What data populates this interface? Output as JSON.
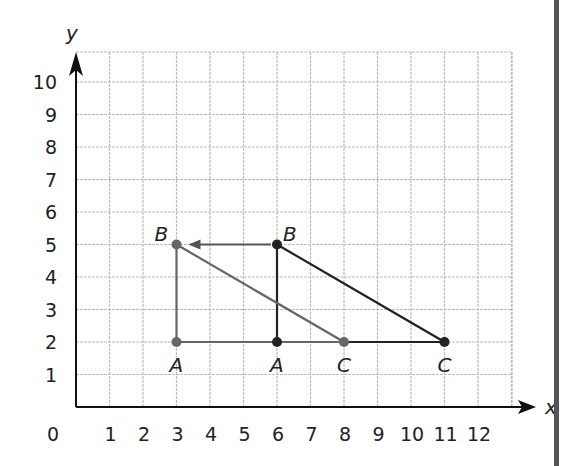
{
  "chart_data": {
    "type": "scatter",
    "title": "",
    "xlabel": "x",
    "ylabel": "y",
    "xlim": [
      0,
      12
    ],
    "ylim": [
      0,
      10
    ],
    "grid": true,
    "x_ticks": [
      "0",
      "1",
      "2",
      "3",
      "4",
      "5",
      "6",
      "7",
      "8",
      "9",
      "10",
      "11",
      "12"
    ],
    "y_ticks": [
      "1",
      "2",
      "3",
      "4",
      "5",
      "6",
      "7",
      "8",
      "9",
      "10"
    ],
    "series": [
      {
        "name": "Original triangle ABC",
        "color": "#222222",
        "points": [
          {
            "label": "A",
            "x": 6,
            "y": 2
          },
          {
            "label": "B",
            "x": 6,
            "y": 5
          },
          {
            "label": "C",
            "x": 11,
            "y": 2
          }
        ]
      },
      {
        "name": "Transformed triangle ABC",
        "color": "#666666",
        "points": [
          {
            "label": "A",
            "x": 3,
            "y": 2
          },
          {
            "label": "B",
            "x": 3,
            "y": 5
          },
          {
            "label": "C",
            "x": 8,
            "y": 2
          }
        ]
      }
    ],
    "annotations": [
      {
        "type": "arrow",
        "from": {
          "x": 6,
          "y": 5
        },
        "to": {
          "x": 3,
          "y": 5
        },
        "description": "translation arrow from B to B'"
      }
    ]
  }
}
